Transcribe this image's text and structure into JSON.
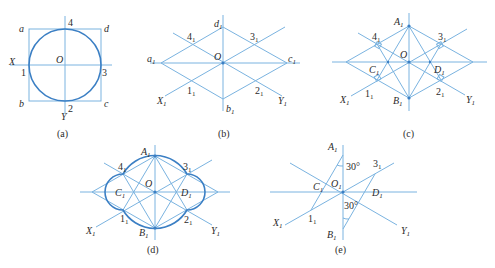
{
  "figure": {
    "colors": {
      "construction_line": "#7ab3e0",
      "curve": "#3b7fc4",
      "text": "#2b2b2b"
    },
    "panels": [
      {
        "id": "a",
        "caption": "(a)",
        "labels": {
          "a": "a",
          "b": "b",
          "c": "c",
          "d": "d",
          "X": "X",
          "Y": "Y",
          "O": "O",
          "p1": "1",
          "p2": "2",
          "p3": "3",
          "p4": "4"
        }
      },
      {
        "id": "b",
        "caption": "(b)",
        "labels": {
          "a1": "a",
          "b1": "b",
          "c1": "c",
          "d1": "d",
          "X1": "X",
          "Y1": "Y",
          "O": "O",
          "p1": "1",
          "p2": "2",
          "p3": "3",
          "p4": "4",
          "sub": "1"
        }
      },
      {
        "id": "c",
        "caption": "(c)",
        "labels": {
          "A1": "A",
          "B1": "B",
          "C1": "C",
          "D1": "D",
          "X1": "X",
          "Y1": "Y",
          "O": "O",
          "p1": "1",
          "p2": "2",
          "p3": "3",
          "p4": "4",
          "sub": "1"
        }
      },
      {
        "id": "d",
        "caption": "(d)",
        "labels": {
          "A1": "A",
          "B1": "B",
          "C1": "C",
          "D1": "D",
          "X1": "X",
          "Y1": "Y",
          "O": "O",
          "p1": "1",
          "p2": "2",
          "p3": "3",
          "p4": "4",
          "sub": "1"
        }
      },
      {
        "id": "e",
        "caption": "(e)",
        "labels": {
          "A1": "A",
          "B1": "B",
          "C1": "C",
          "D1": "D",
          "X1": "X",
          "Y1": "Y",
          "O1": "O",
          "p1": "1",
          "p3": "3",
          "sub": "1",
          "angle_top": "30°",
          "angle_bottom": "30°"
        }
      }
    ]
  }
}
